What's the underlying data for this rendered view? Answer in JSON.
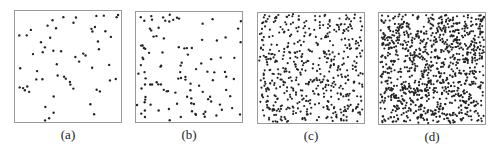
{
  "figure": {
    "background": "#ffffff",
    "border_color": "#9a9a9a",
    "dot_color": "#222222",
    "panels": [
      {
        "id": "a",
        "label": "(a)",
        "box": {
          "x": 14,
          "y": 10,
          "w": 108,
          "h": 113
        },
        "dot_count": 60,
        "seed": 11,
        "dot_r": 1.2
      },
      {
        "id": "b",
        "label": "(b)",
        "box": {
          "x": 135,
          "y": 11,
          "w": 108,
          "h": 112
        },
        "dot_count": 110,
        "seed": 23,
        "dot_r": 1.2
      },
      {
        "id": "c",
        "label": "(c)",
        "box": {
          "x": 257,
          "y": 12,
          "w": 108,
          "h": 112
        },
        "dot_count": 520,
        "seed": 37,
        "dot_r": 1.1
      },
      {
        "id": "d",
        "label": "(d)",
        "box": {
          "x": 378,
          "y": 12,
          "w": 108,
          "h": 113
        },
        "dot_count": 1000,
        "seed": 53,
        "dot_r": 1.1
      }
    ]
  }
}
